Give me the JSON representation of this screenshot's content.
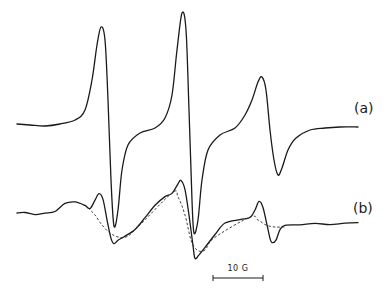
{
  "chart_data": {
    "type": "line",
    "title": "",
    "xlabel": "",
    "ylabel": "",
    "grid": false,
    "legend": null,
    "series": [
      {
        "name": "(a)",
        "style": "solid",
        "points_px": [
          [
            17,
            124
          ],
          [
            30,
            125
          ],
          [
            45,
            126
          ],
          [
            60,
            124
          ],
          [
            75,
            120
          ],
          [
            85,
            110
          ],
          [
            92,
            80
          ],
          [
            97,
            45
          ],
          [
            101,
            27
          ],
          [
            105,
            40
          ],
          [
            108,
            100
          ],
          [
            111,
            180
          ],
          [
            114,
            226
          ],
          [
            118,
            210
          ],
          [
            122,
            170
          ],
          [
            128,
            145
          ],
          [
            140,
            133
          ],
          [
            155,
            128
          ],
          [
            165,
            118
          ],
          [
            172,
            95
          ],
          [
            177,
            50
          ],
          [
            182,
            13
          ],
          [
            186,
            30
          ],
          [
            189,
            110
          ],
          [
            192,
            200
          ],
          [
            194,
            233
          ],
          [
            198,
            220
          ],
          [
            202,
            180
          ],
          [
            208,
            150
          ],
          [
            220,
            135
          ],
          [
            235,
            128
          ],
          [
            245,
            115
          ],
          [
            252,
            100
          ],
          [
            258,
            82
          ],
          [
            262,
            77
          ],
          [
            266,
            90
          ],
          [
            270,
            130
          ],
          [
            274,
            160
          ],
          [
            278,
            175
          ],
          [
            282,
            168
          ],
          [
            288,
            150
          ],
          [
            296,
            138
          ],
          [
            310,
            130
          ],
          [
            325,
            128
          ],
          [
            340,
            127
          ],
          [
            358,
            127
          ]
        ]
      },
      {
        "name": "(b)",
        "style": "solid",
        "points_px": [
          [
            17,
            213
          ],
          [
            25,
            212
          ],
          [
            35,
            214
          ],
          [
            45,
            213
          ],
          [
            55,
            212
          ],
          [
            65,
            204
          ],
          [
            75,
            202
          ],
          [
            85,
            205
          ],
          [
            90,
            208
          ],
          [
            95,
            200
          ],
          [
            99,
            194
          ],
          [
            103,
            200
          ],
          [
            107,
            220
          ],
          [
            111,
            238
          ],
          [
            114,
            243
          ],
          [
            118,
            240
          ],
          [
            124,
            237
          ],
          [
            135,
            230
          ],
          [
            145,
            218
          ],
          [
            155,
            205
          ],
          [
            165,
            196
          ],
          [
            172,
            193
          ],
          [
            178,
            184
          ],
          [
            181,
            181
          ],
          [
            185,
            190
          ],
          [
            189,
            215
          ],
          [
            193,
            245
          ],
          [
            195,
            258
          ],
          [
            199,
            255
          ],
          [
            205,
            248
          ],
          [
            215,
            235
          ],
          [
            225,
            223
          ],
          [
            240,
            219
          ],
          [
            250,
            217
          ],
          [
            255,
            210
          ],
          [
            259,
            202
          ],
          [
            263,
            208
          ],
          [
            267,
            225
          ],
          [
            270,
            238
          ],
          [
            272,
            242
          ],
          [
            276,
            240
          ],
          [
            280,
            230
          ],
          [
            285,
            226
          ],
          [
            300,
            225
          ],
          [
            315,
            223
          ],
          [
            330,
            224
          ],
          [
            345,
            223
          ],
          [
            358,
            223
          ]
        ]
      },
      {
        "name": "broad component (dashed)",
        "style": "dashed",
        "points_px": [
          [
            88,
            208
          ],
          [
            95,
            215
          ],
          [
            102,
            225
          ],
          [
            110,
            233
          ],
          [
            118,
            237
          ],
          [
            126,
            237
          ],
          [
            135,
            230
          ],
          [
            172,
            193
          ],
          [
            178,
            197
          ],
          [
            185,
            215
          ],
          [
            191,
            240
          ],
          [
            197,
            250
          ],
          [
            205,
            250
          ],
          [
            214,
            238
          ],
          [
            250,
            217
          ],
          [
            258,
            220
          ],
          [
            266,
            225
          ],
          [
            275,
            227
          ],
          [
            285,
            227
          ]
        ]
      }
    ],
    "labels": [
      "(a)",
      "(b)"
    ],
    "scale_bar": {
      "label": "10 G",
      "length_px": 50
    },
    "peaks_px": {
      "a": [
        [
          101,
          27
        ],
        [
          182,
          13
        ],
        [
          262,
          77
        ]
      ],
      "a_troughs": [
        [
          114,
          226
        ],
        [
          194,
          233
        ],
        [
          278,
          175
        ]
      ]
    }
  },
  "labels": {
    "a": "(a)",
    "b": "(b)",
    "scale": "10 G"
  }
}
